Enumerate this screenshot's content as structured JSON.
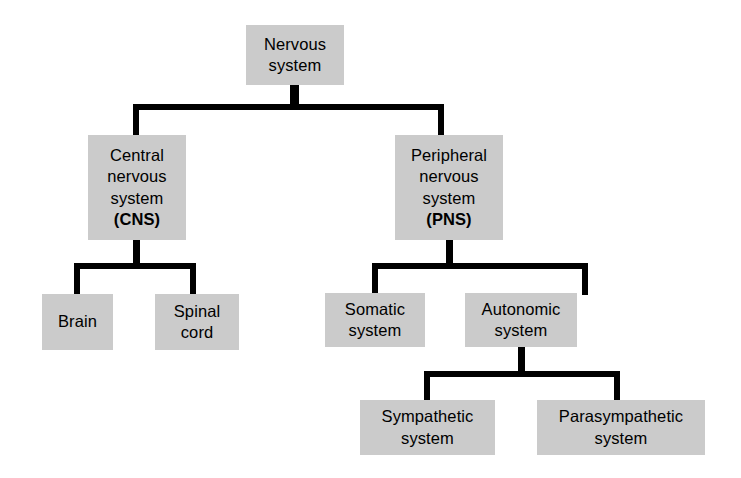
{
  "diagram": {
    "type": "hierarchy-tree",
    "box_fill_color": "#cbcbcb",
    "connector_color": "#000000",
    "background_color": "#ffffff",
    "nodes": [
      {
        "id": "nervous-system",
        "lines": [
          "Nervous",
          "system"
        ],
        "bold_lines": [],
        "level": 0,
        "x": 246,
        "y": 25,
        "w": 98,
        "h": 60
      },
      {
        "id": "central-nervous-system",
        "lines": [
          "Central",
          "nervous",
          "system",
          "(CNS)"
        ],
        "bold_lines": [
          "(CNS)"
        ],
        "level": 1,
        "x": 88,
        "y": 135,
        "w": 98,
        "h": 105
      },
      {
        "id": "peripheral-nervous-system",
        "lines": [
          "Peripheral",
          "nervous",
          "system",
          "(PNS)"
        ],
        "bold_lines": [
          "(PNS)"
        ],
        "level": 1,
        "x": 395,
        "y": 135,
        "w": 108,
        "h": 105
      },
      {
        "id": "brain",
        "lines": [
          "Brain"
        ],
        "bold_lines": [],
        "level": 2,
        "x": 42,
        "y": 294,
        "w": 71,
        "h": 56
      },
      {
        "id": "spinal-cord",
        "lines": [
          "Spinal",
          "cord"
        ],
        "bold_lines": [],
        "level": 2,
        "x": 155,
        "y": 294,
        "w": 84,
        "h": 56
      },
      {
        "id": "somatic-system",
        "lines": [
          "Somatic",
          "system"
        ],
        "bold_lines": [],
        "level": 2,
        "x": 325,
        "y": 293,
        "w": 100,
        "h": 54
      },
      {
        "id": "autonomic-system",
        "lines": [
          "Autonomic",
          "system"
        ],
        "bold_lines": [],
        "level": 2,
        "x": 465,
        "y": 293,
        "w": 112,
        "h": 54
      },
      {
        "id": "sympathetic-system",
        "lines": [
          "Sympathetic",
          "system"
        ],
        "bold_lines": [],
        "level": 3,
        "x": 360,
        "y": 400,
        "w": 135,
        "h": 55
      },
      {
        "id": "parasympathetic-system",
        "lines": [
          "Parasympathetic",
          "system"
        ],
        "bold_lines": [],
        "level": 3,
        "x": 537,
        "y": 400,
        "w": 168,
        "h": 55
      }
    ],
    "edges": [
      {
        "id": "edge-root-split",
        "from": "nervous-system",
        "to": [
          "central-nervous-system",
          "peripheral-nervous-system"
        ]
      },
      {
        "id": "edge-cns-split",
        "from": "central-nervous-system",
        "to": [
          "brain",
          "spinal-cord"
        ]
      },
      {
        "id": "edge-pns-split",
        "from": "peripheral-nervous-system",
        "to": [
          "somatic-system",
          "autonomic-system"
        ]
      },
      {
        "id": "edge-autonomic-split",
        "from": "autonomic-system",
        "to": [
          "sympathetic-system",
          "parasympathetic-system"
        ]
      }
    ]
  }
}
